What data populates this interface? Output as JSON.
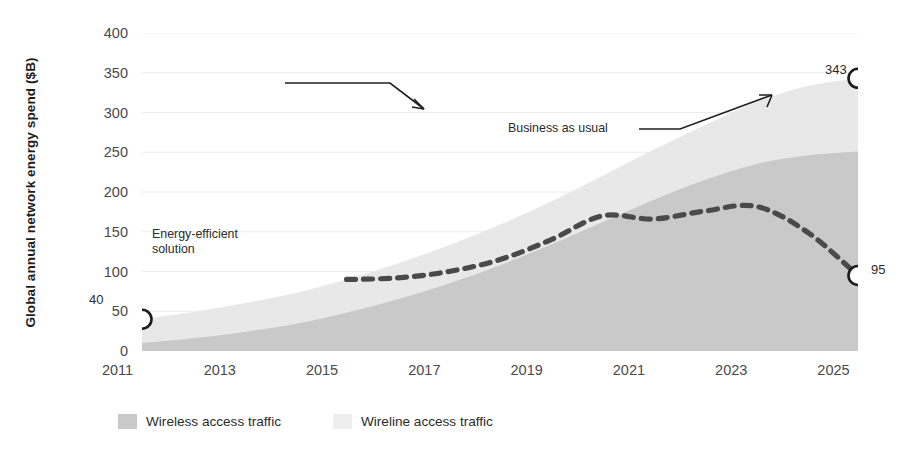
{
  "chart_data": {
    "type": "area",
    "title": "",
    "xlabel": "",
    "ylabel": "Global annual network energy spend ($B)",
    "xlim": [
      2011,
      2025
    ],
    "ylim": [
      0,
      400
    ],
    "grid": true,
    "legend_position": "bottom-left",
    "x": [
      2011,
      2012,
      2013,
      2014,
      2015,
      2016,
      2017,
      2018,
      2019,
      2020,
      2021,
      2022,
      2023,
      2024,
      2025
    ],
    "series": [
      {
        "name": "Wireless access traffic",
        "color": "#c9c9c9",
        "stacked": true,
        "values": [
          10,
          16,
          24,
          34,
          48,
          65,
          85,
          108,
          134,
          162,
          190,
          215,
          235,
          246,
          251
        ]
      },
      {
        "name": "Wireline access traffic",
        "color": "#e8e8e8",
        "stacked": true,
        "values": [
          30,
          33,
          36,
          39,
          42,
          45,
          48,
          51,
          54,
          58,
          63,
          69,
          78,
          87,
          92
        ]
      }
    ],
    "total_series": {
      "name": "Business as usual",
      "values": [
        40,
        49,
        60,
        73,
        90,
        110,
        133,
        159,
        188,
        220,
        253,
        284,
        313,
        333,
        343
      ]
    },
    "dashed_series": {
      "name": "Energy-efficient solution",
      "style": "dashed",
      "color": "#4a4a4a",
      "x": [
        2015,
        2016,
        2017,
        2018,
        2019,
        2020,
        2021,
        2022,
        2023,
        2024,
        2025
      ],
      "values": [
        90,
        92,
        100,
        115,
        140,
        170,
        166,
        176,
        182,
        150,
        95
      ]
    },
    "markers": [
      {
        "label": "40",
        "x": 2011,
        "y": 40
      },
      {
        "label": "343",
        "x": 2025,
        "y": 343
      },
      {
        "label": "95",
        "x": 2025,
        "y": 95
      }
    ],
    "annotations": [
      {
        "name": "energy-efficient-solution",
        "text": "Energy-efficient\nsolution",
        "line1": "Energy-efficient",
        "line2": "solution"
      },
      {
        "name": "business-as-usual",
        "text": "Business as usual"
      }
    ],
    "yticks": [
      "0",
      "50",
      "100",
      "150",
      "200",
      "250",
      "300",
      "350",
      "400"
    ],
    "ytick_values": [
      0,
      50,
      100,
      150,
      200,
      250,
      300,
      350,
      400
    ],
    "xticks": [
      "2011",
      "2013",
      "2015",
      "2017",
      "2019",
      "2021",
      "2023",
      "2025"
    ],
    "xtick_values": [
      2011,
      2013,
      2015,
      2017,
      2019,
      2021,
      2023,
      2025
    ]
  },
  "legend": {
    "items": [
      {
        "label": "Wireless access traffic",
        "color": "#c9c9c9"
      },
      {
        "label": "Wireline access traffic",
        "color": "#eeeeee"
      }
    ]
  },
  "axis": {
    "y_title": "Global annual network energy spend ($B)"
  },
  "callouts": {
    "efficient_line1": "Energy-efficient",
    "efficient_line2": "solution",
    "business": "Business as usual"
  },
  "values": {
    "start": "40",
    "bau_end": "343",
    "eff_end": "95"
  }
}
